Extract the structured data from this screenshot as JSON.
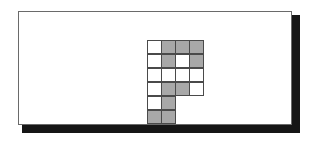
{
  "figure": {
    "shape_name": "P-pentomino-style grid",
    "panel": {
      "border_color": "#6a6a6a",
      "background_color": "#ffffff",
      "shadow_color": "#161616"
    },
    "grid": {
      "columns": 4,
      "rows": 6,
      "cell_size_px": 15,
      "filled_color": "#a8a8a8",
      "empty_color": "#ffffff",
      "line_color": "#4a4a4a",
      "legend": {
        "filled": "shaded cell",
        "empty": "unshaded cell",
        "blank": "no cell"
      },
      "cells": [
        [
          "empty",
          "filled",
          "filled",
          "filled"
        ],
        [
          "empty",
          "filled",
          "empty",
          "filled"
        ],
        [
          "empty",
          "empty",
          "empty",
          "empty"
        ],
        [
          "empty",
          "filled",
          "filled",
          "empty"
        ],
        [
          "empty",
          "filled",
          "blank",
          "blank"
        ],
        [
          "filled",
          "filled",
          "blank",
          "blank"
        ]
      ],
      "filled_count": 9,
      "empty_count": 11
    }
  }
}
